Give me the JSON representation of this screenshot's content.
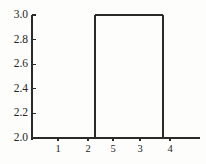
{
  "figure": {
    "width": 206,
    "height": 164,
    "background_color": "#fdfdfb",
    "line_color": "#2a2a2a",
    "text_color": "#262626"
  },
  "chart_data": {
    "type": "line",
    "chart_subtype": "dendrogram",
    "title": "",
    "subtitle": "",
    "xlabel": "",
    "ylabel": "",
    "grid": false,
    "legend": null,
    "legend_position": "none",
    "orientation": "vertical",
    "ylim": [
      1.94,
      3.06
    ],
    "yticks": [
      2.0,
      2.2,
      2.4,
      2.6,
      2.8,
      3.0
    ],
    "ytick_labels": [
      "2.0",
      "2.2",
      "2.4",
      "2.6",
      "2.8",
      "3.0"
    ],
    "leaf_order": [
      1,
      2,
      5,
      3,
      4
    ],
    "leaf_labels": [
      "1",
      "2",
      "5",
      "3",
      "4"
    ],
    "leaf_positions": [
      58,
      88,
      113,
      140,
      170
    ],
    "baseline_value": 2.0,
    "merges": [
      {
        "id": "m1",
        "label": "1-2",
        "members": [
          "1",
          "2"
        ],
        "height": 2.0,
        "left_x": 58,
        "right_x": 88,
        "center_x": 73
      },
      {
        "id": "m2",
        "label": "(1,2)-5",
        "members": [
          "1",
          "2",
          "5"
        ],
        "height": 2.0,
        "left_x": 73,
        "right_x": 113,
        "center_x": 95
      },
      {
        "id": "m3",
        "label": "3-4",
        "members": [
          "3",
          "4"
        ],
        "height": 2.0,
        "left_x": 140,
        "right_x": 170,
        "center_x": 155
      },
      {
        "id": "m4",
        "label": "root",
        "members": [
          "1",
          "2",
          "5",
          "3",
          "4"
        ],
        "height": 3.0,
        "left_x": 95,
        "right_x": 163,
        "center_x": 129
      }
    ],
    "axis": {
      "y_axis_x": 32,
      "x_axis_y": 138,
      "x_axis_left": 32,
      "x_axis_right": 200,
      "y_axis_top": 15,
      "y_axis_bottom": 140,
      "tick_length": 4
    }
  }
}
